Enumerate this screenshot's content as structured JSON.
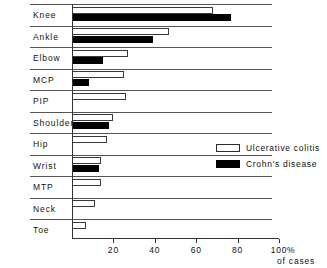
{
  "chart_data": {
    "type": "bar",
    "orientation": "horizontal",
    "title": "",
    "xlabel": "% of cases",
    "ylabel": "",
    "xlim": [
      0,
      100
    ],
    "xticks": [
      20,
      40,
      60,
      80,
      100
    ],
    "xtick_labels": [
      "20",
      "40",
      "60",
      "80",
      "100"
    ],
    "grid": false,
    "legend_position": "middle-right",
    "categories": [
      "Knee",
      "Ankle",
      "Elbow",
      "MCP",
      "PIP",
      "Shoulder",
      "Hip",
      "Wrist",
      "MTP",
      "Neck",
      "Toe"
    ],
    "series": [
      {
        "name": "Ulcerative colitis",
        "color": "#ffffff",
        "values": [
          68,
          47,
          27,
          25,
          26,
          20,
          17,
          14,
          14,
          11,
          7
        ]
      },
      {
        "name": "Crohn's disease",
        "color": "#000000",
        "values": [
          77,
          39,
          15,
          8,
          0,
          18,
          0,
          13,
          0,
          0,
          0
        ]
      }
    ]
  },
  "axis": {
    "unit_percent": "100 %",
    "unit_caption": "of cases"
  },
  "legend": {
    "items": [
      {
        "label": "Ulcerative colitis",
        "swatch": "white-open-rectangle"
      },
      {
        "label": "Crohn's disease",
        "swatch": "black-filled-rectangle"
      }
    ]
  }
}
